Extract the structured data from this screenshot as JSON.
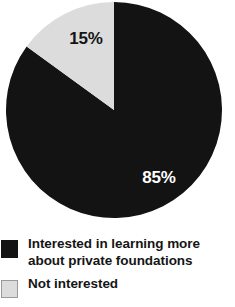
{
  "chart_data": {
    "type": "pie",
    "title": "",
    "subtitle": "",
    "xlabel": "",
    "ylabel": "",
    "legend_position": "bottom-left",
    "grid": false,
    "start_angle_deg": 0,
    "categories": [
      "Interested in learning more about private foundations",
      "Not interested"
    ],
    "values": [
      85,
      15
    ],
    "value_labels": [
      "85%",
      "15%"
    ],
    "colors": [
      "#131313",
      "#dcdcdc"
    ],
    "slices": [
      {
        "name": "Interested in learning more about private foundations",
        "value": 85,
        "label": "85%",
        "color": "#131313",
        "label_color": "#ffffff",
        "direction": "clockwise-from-top",
        "sweep_deg": 306
      },
      {
        "name": "Not interested",
        "value": 15,
        "label": "15%",
        "color": "#dcdcdc",
        "label_color": "#141414",
        "direction": "counterclockwise-from-top",
        "sweep_deg": 54
      }
    ]
  },
  "pie": {
    "major_label": "85%",
    "minor_label": "15%",
    "major_color": "#131313",
    "minor_color": "#dcdcdc"
  },
  "legend": {
    "items": [
      {
        "swatch_color": "#131313",
        "swatch_style": "dark",
        "line1": "Interested in learning more",
        "line2": "about private foundations"
      },
      {
        "swatch_color": "#dcdcdc",
        "swatch_style": "light",
        "line1": "Not interested",
        "line2": ""
      }
    ]
  }
}
